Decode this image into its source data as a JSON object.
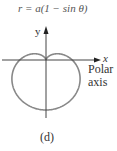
{
  "figure": {
    "equation": "r = a(1 − sin θ)",
    "y_axis_label": "y",
    "x_axis_label": "x",
    "polar_axis_label_line1": "Polar",
    "polar_axis_label_line2": "axis",
    "caption": "(d)"
  },
  "chart_data": {
    "type": "line",
    "title": "r = a(1 − sin θ)",
    "curve": "cardioid",
    "equation": {
      "r": "a(1 - sin θ)",
      "a": 1
    },
    "xlabel": "x",
    "ylabel": "y",
    "annotations": [
      "Polar axis",
      "(d)"
    ],
    "origin_px": [
      46,
      60
    ],
    "scale_px_per_a": 25,
    "colors": {
      "curve": "#888888",
      "axes": "#444444"
    }
  }
}
